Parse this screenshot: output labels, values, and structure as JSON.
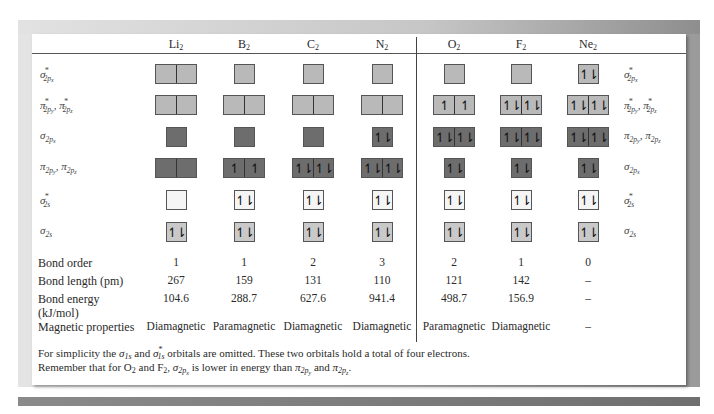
{
  "columns": [
    {
      "key": "Li2",
      "base": "Li",
      "sub": "2",
      "x": 176
    },
    {
      "key": "B2",
      "base": "B",
      "sub": "2",
      "x": 244
    },
    {
      "key": "C2",
      "base": "C",
      "sub": "2",
      "x": 313
    },
    {
      "key": "N2",
      "base": "N",
      "sub": "2",
      "x": 382
    },
    {
      "key": "O2",
      "base": "O",
      "sub": "2",
      "x": 454
    },
    {
      "key": "F2",
      "base": "F",
      "sub": "2",
      "x": 521
    },
    {
      "key": "Ne2",
      "base": "Ne",
      "sub": "2",
      "x": 588
    }
  ],
  "orbital_labels_left": [
    {
      "sym": "σ",
      "sub": "2p",
      "sub2": "x",
      "star": "*"
    },
    {
      "sym": "π",
      "sub": "2p",
      "sub2": "y",
      "star": "*",
      "sym_b": "π",
      "sub_b": "2p",
      "sub2_b": "z",
      "star_b": "*"
    },
    {
      "sym": "σ",
      "sub": "2p",
      "sub2": "x",
      "star": ""
    },
    {
      "sym": "π",
      "sub": "2p",
      "sub2": "y",
      "star": "",
      "sym_b": "π",
      "sub_b": "2p",
      "sub2_b": "z",
      "star_b": ""
    },
    {
      "sym": "σ",
      "sub": "2s",
      "sub2": "",
      "star": "*"
    },
    {
      "sym": "σ",
      "sub": "2s",
      "sub2": "",
      "star": ""
    }
  ],
  "orbital_labels_right": [
    {
      "sym": "σ",
      "sub": "2p",
      "sub2": "x",
      "star": "*"
    },
    {
      "sym": "π",
      "sub": "2p",
      "sub2": "y",
      "star": "*",
      "sym_b": "π",
      "sub_b": "2p",
      "sub2_b": "z",
      "star_b": "*"
    },
    {
      "sym": "π",
      "sub": "2p",
      "sub2": "y",
      "star": "",
      "sym_b": "π",
      "sub_b": "2p",
      "sub2_b": "z",
      "star_b": ""
    },
    {
      "sym": "σ",
      "sub": "2p",
      "sub2": "x",
      "star": ""
    },
    {
      "sym": "σ",
      "sub": "2s",
      "sub2": "",
      "star": "*"
    },
    {
      "sym": "σ",
      "sub": "2s",
      "sub2": "",
      "star": ""
    }
  ],
  "orbital_boxes": {
    "Li2": [
      [
        "",
        ""
      ],
      [
        "",
        ""
      ],
      [
        ""
      ],
      [
        "",
        ""
      ],
      [
        ""
      ],
      [
        "↿⇂"
      ]
    ],
    "B2": [
      [
        ""
      ],
      [
        "",
        ""
      ],
      [
        ""
      ],
      [
        "↿",
        "↿"
      ],
      [
        "↿⇂"
      ],
      [
        "↿⇂"
      ]
    ],
    "C2": [
      [
        ""
      ],
      [
        "",
        ""
      ],
      [
        ""
      ],
      [
        "↿⇂",
        "↿⇂"
      ],
      [
        "↿⇂"
      ],
      [
        "↿⇂"
      ]
    ],
    "N2": [
      [
        ""
      ],
      [
        "",
        ""
      ],
      [
        "↿⇂"
      ],
      [
        "↿⇂",
        "↿⇂"
      ],
      [
        "↿⇂"
      ],
      [
        "↿⇂"
      ]
    ],
    "O2": [
      [
        ""
      ],
      [
        "↿",
        "↿"
      ],
      [
        "↿⇂",
        "↿⇂"
      ],
      [
        "↿⇂"
      ],
      [
        "↿⇂"
      ],
      [
        "↿⇂"
      ]
    ],
    "F2": [
      [
        ""
      ],
      [
        "↿⇂",
        "↿⇂"
      ],
      [
        "↿⇂",
        "↿⇂"
      ],
      [
        "↿⇂"
      ],
      [
        "↿⇂"
      ],
      [
        "↿⇂"
      ]
    ],
    "Ne2": [
      [
        "↿⇂"
      ],
      [
        "↿⇂",
        "↿⇂"
      ],
      [
        "↿⇂",
        "↿⇂"
      ],
      [
        "↿⇂"
      ],
      [
        "↿⇂"
      ],
      [
        "↿⇂"
      ]
    ]
  },
  "colors": {
    "antibonding_2p": "#b9b9b9",
    "bonding_2p": "#6d6d6d",
    "antibonding_2s": "#f5f5f5",
    "bonding_2s": "#c9c9c9",
    "frame": "#cfcfcf"
  },
  "properties": {
    "bond_order": {
      "label": "Bond order",
      "values": [
        "1",
        "1",
        "2",
        "3",
        "2",
        "1",
        "0"
      ]
    },
    "bond_length": {
      "label": "Bond length (pm)",
      "values": [
        "267",
        "159",
        "131",
        "110",
        "121",
        "142",
        "–"
      ]
    },
    "bond_energy": {
      "label": "Bond energy",
      "label2": "(kJ/mol)",
      "values": [
        "104.6",
        "288.7",
        "627.6",
        "941.4",
        "498.7",
        "156.9",
        "–"
      ]
    },
    "magnetic": {
      "label": "Magnetic properties",
      "values": [
        "Diamagnetic",
        "Paramagnetic",
        "Diamagnetic",
        "Diamagnetic",
        "Paramagnetic",
        "Diamagnetic",
        "–"
      ]
    }
  },
  "footnotes": {
    "line1_a": "For simplicity the ",
    "line1_sym1": "σ",
    "line1_sub1": "1s",
    "line1_b": " and ",
    "line1_sym2": "σ",
    "line1_sup2": "*",
    "line1_sub2": "1s",
    "line1_c": " orbitals are omitted.  These two orbitals hold a total of four electrons.",
    "line2_a": "Remember that for O",
    "line2_sub_a": "2",
    "line2_b": " and F",
    "line2_sub_b": "2",
    "line2_c": ", ",
    "line2_sym1": "σ",
    "line2_sub1": "2p",
    "line2_sub1b": "x",
    "line2_d": " is lower in energy than ",
    "line2_sym2": "π",
    "line2_sub2": "2p",
    "line2_sub2b": "y",
    "line2_e": " and ",
    "line2_sym3": "π",
    "line2_sub3": "2p",
    "line2_sub3b": "z",
    "line2_f": "."
  }
}
